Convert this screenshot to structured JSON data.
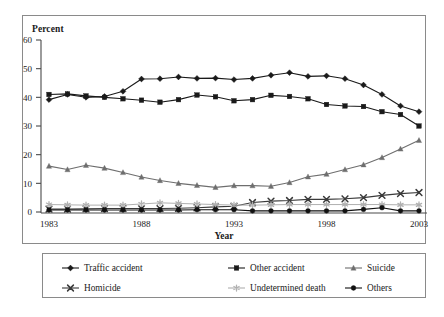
{
  "chart_data": {
    "type": "line",
    "title": "",
    "xlabel": "Year",
    "ylabel": "Percent",
    "xlim": [
      1983,
      2003
    ],
    "ylim": [
      0,
      60
    ],
    "ytick_labels": [
      "0",
      "10",
      "20",
      "30",
      "40",
      "50",
      "60"
    ],
    "yticks": [
      0,
      10,
      20,
      30,
      40,
      50,
      60
    ],
    "xtick_labels": [
      "1983",
      "1988",
      "1993",
      "1998",
      "2003"
    ],
    "xticks": [
      1983,
      1988,
      1993,
      1998,
      2003
    ],
    "grid": false,
    "legend_position": "below",
    "x": [
      1983,
      1984,
      1985,
      1986,
      1987,
      1988,
      1989,
      1990,
      1991,
      1992,
      1993,
      1994,
      1995,
      1996,
      1997,
      1998,
      1999,
      2000,
      2001,
      2002,
      2003
    ],
    "series": [
      {
        "name": "Traffic accident",
        "marker": "diamond",
        "color": "#1a1a1a",
        "values": [
          39.2,
          41.0,
          40.0,
          40.3,
          42.1,
          46.4,
          46.5,
          47.1,
          46.6,
          46.7,
          46.2,
          46.6,
          47.7,
          48.6,
          47.3,
          47.5,
          46.5,
          44.3,
          41.0,
          37.0,
          35.0
        ]
      },
      {
        "name": "Other accident",
        "marker": "square",
        "color": "#1a1a1a",
        "values": [
          41.0,
          41.2,
          40.5,
          40.0,
          39.5,
          39.0,
          38.3,
          39.2,
          40.8,
          40.2,
          38.8,
          39.2,
          40.7,
          40.3,
          39.5,
          37.5,
          37.0,
          36.8,
          35.0,
          34.0,
          30.0
        ]
      },
      {
        "name": "Suicide",
        "marker": "triangle",
        "color": "#6e6e6e",
        "values": [
          16.0,
          14.8,
          16.3,
          15.3,
          13.8,
          12.2,
          11.0,
          10.0,
          9.3,
          8.6,
          9.2,
          9.2,
          9.0,
          10.3,
          12.3,
          13.2,
          14.8,
          16.5,
          19.0,
          22.0,
          25.0
        ]
      },
      {
        "name": "Homicide",
        "marker": "x",
        "color": "#3a3a3a",
        "values": [
          1.0,
          1.0,
          1.1,
          1.2,
          1.2,
          1.2,
          1.2,
          1.3,
          1.5,
          1.8,
          2.0,
          3.3,
          3.8,
          4.0,
          4.4,
          4.4,
          4.6,
          5.0,
          5.8,
          6.4,
          6.8
        ]
      },
      {
        "name": "Undetermined death",
        "marker": "asterisk",
        "color": "#b0b0b0",
        "values": [
          2.6,
          2.5,
          2.4,
          2.4,
          2.4,
          2.8,
          3.2,
          3.0,
          2.8,
          2.6,
          2.4,
          2.4,
          2.5,
          2.6,
          2.6,
          2.6,
          2.6,
          2.6,
          2.6,
          2.5,
          2.5
        ]
      },
      {
        "name": "Others",
        "marker": "circle",
        "color": "#111111",
        "values": [
          0.7,
          0.7,
          0.7,
          0.7,
          0.7,
          0.7,
          0.7,
          0.7,
          0.8,
          0.8,
          0.8,
          0.4,
          0.4,
          0.4,
          0.4,
          0.4,
          0.4,
          0.9,
          1.5,
          0.4,
          0.4
        ]
      }
    ]
  },
  "legend": {
    "entries": [
      {
        "label": "Traffic accident",
        "marker": "diamond"
      },
      {
        "label": "Other accident",
        "marker": "square"
      },
      {
        "label": "Suicide",
        "marker": "triangle"
      },
      {
        "label": "Homicide",
        "marker": "x"
      },
      {
        "label": "Undetermined death",
        "marker": "asterisk"
      },
      {
        "label": "Others",
        "marker": "circle"
      }
    ]
  },
  "axes": {
    "y_title": "Percent",
    "x_title": "Year"
  }
}
